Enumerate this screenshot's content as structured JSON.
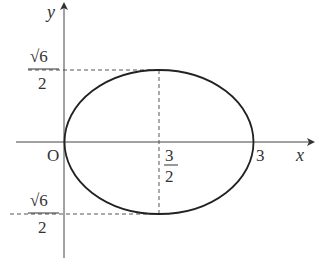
{
  "diagram": {
    "type": "ellipse-on-axes",
    "axes": {
      "x_label": "x",
      "y_label": "y",
      "origin_label": "O"
    },
    "ellipse": {
      "center_x_label_num": "3",
      "center_x_label_den": "2",
      "right_intercept_label": "3",
      "top_label_num": "√6",
      "top_label_den": "2",
      "bottom_label_sign": "−",
      "bottom_label_num": "√6",
      "bottom_label_den": "2"
    },
    "colors": {
      "curve": "#222222",
      "axis": "#444444",
      "dashed": "#555555",
      "text": "#333333"
    }
  }
}
